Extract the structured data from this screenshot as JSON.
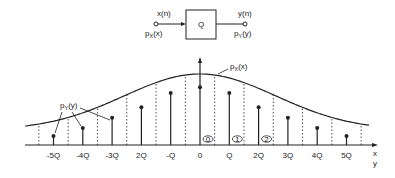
{
  "block_diagram": {
    "input_signal": "x(n)",
    "input_pdf": {
      "p": "p",
      "sub": "X",
      "arg": "(x)"
    },
    "block_label": "Q",
    "output_signal": "y(n)",
    "output_pdf": {
      "p": "p",
      "sub": "Y",
      "arg": "(y)"
    }
  },
  "plot": {
    "curve_label": {
      "p": "p",
      "sub": "X",
      "arg": "(x)"
    },
    "stem_label": {
      "p": "p",
      "sub": "Y",
      "arg": "(y)"
    },
    "x_axis_labels": [
      "x",
      "y"
    ],
    "tick_labels": [
      "-5Q",
      "-4Q",
      "-3Q",
      "2Q",
      "-Q",
      "0",
      "Q",
      "2Q",
      "3Q",
      "4Q",
      "5Q"
    ],
    "stem_values": [
      0.14,
      0.26,
      0.42,
      0.58,
      0.8,
      0.89,
      0.8,
      0.58,
      0.42,
      0.26,
      0.14
    ],
    "oval_markers": [
      "0",
      "1",
      "2"
    ]
  }
}
